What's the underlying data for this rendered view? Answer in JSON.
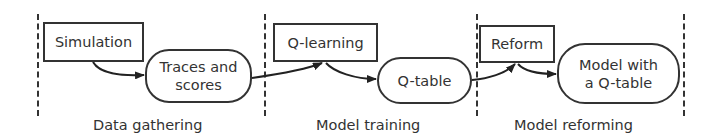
{
  "diagram": {
    "type": "pipeline",
    "stages": [
      {
        "label": "Data gathering",
        "nodes": [
          {
            "id": "simulation",
            "shape": "rectangle",
            "text": "Simulation"
          },
          {
            "id": "traces",
            "shape": "rounded",
            "text_lines": [
              "Traces and",
              "scores"
            ]
          }
        ]
      },
      {
        "label": "Model training",
        "nodes": [
          {
            "id": "qlearning",
            "shape": "rectangle",
            "text": "Q-learning"
          },
          {
            "id": "qtable",
            "shape": "rounded",
            "text": "Q-table"
          }
        ]
      },
      {
        "label": "Model reforming",
        "nodes": [
          {
            "id": "reform",
            "shape": "rectangle",
            "text": "Reform"
          },
          {
            "id": "model",
            "shape": "rounded",
            "text_lines": [
              "Model with",
              "a Q-table"
            ]
          }
        ]
      }
    ],
    "edges": [
      {
        "from": "simulation",
        "to": "traces"
      },
      {
        "from": "traces",
        "to": "qlearning"
      },
      {
        "from": "qlearning",
        "to": "qtable"
      },
      {
        "from": "qtable",
        "to": "reform"
      },
      {
        "from": "reform",
        "to": "model"
      }
    ],
    "colors": {
      "stroke": "#333333",
      "background": "#ffffff"
    }
  }
}
